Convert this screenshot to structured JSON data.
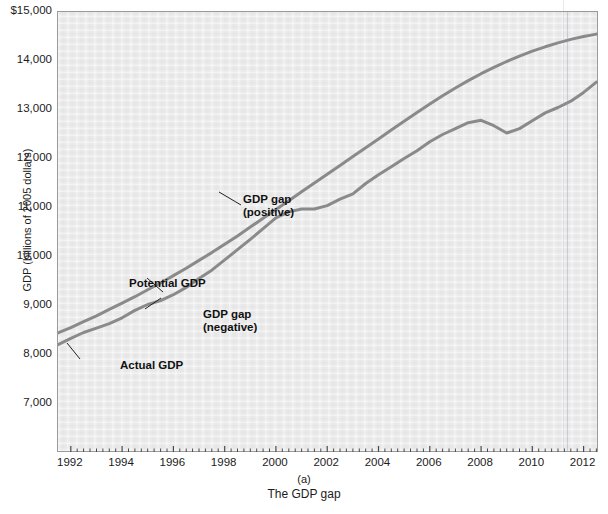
{
  "figure": {
    "panel_letter": "(a)",
    "caption": "The GDP gap"
  },
  "axes": {
    "ylabel": "GDP (billions of 2005 dollars)",
    "yticks": [
      {
        "label": "$15,000",
        "value": 15000
      },
      {
        "label": "14,000",
        "value": 14000
      },
      {
        "label": "13,000",
        "value": 13000
      },
      {
        "label": "12,000",
        "value": 12000
      },
      {
        "label": "11,000",
        "value": 11000
      },
      {
        "label": "10,000",
        "value": 10000
      },
      {
        "label": "9,000",
        "value": 9000
      },
      {
        "label": "8,000",
        "value": 8000
      },
      {
        "label": "7,000",
        "value": 7000
      }
    ],
    "xticks": [
      {
        "label": "1992",
        "value": 1992
      },
      {
        "label": "1994",
        "value": 1994
      },
      {
        "label": "1996",
        "value": 1996
      },
      {
        "label": "1998",
        "value": 1998
      },
      {
        "label": "2000",
        "value": 2000
      },
      {
        "label": "2002",
        "value": 2002
      },
      {
        "label": "2004",
        "value": 2004
      },
      {
        "label": "2006",
        "value": 2006
      },
      {
        "label": "2008",
        "value": 2008
      },
      {
        "label": "2010",
        "value": 2010
      },
      {
        "label": "2012",
        "value": 2012
      }
    ]
  },
  "annotations": [
    {
      "id": "gap-positive",
      "line1": "GDP gap",
      "line2": "(positive)"
    },
    {
      "id": "potential-gdp",
      "line1": "Potential GDP",
      "line2": ""
    },
    {
      "id": "gap-negative",
      "line1": "GDP gap",
      "line2": "(negative)"
    },
    {
      "id": "actual-gdp",
      "line1": "Actual GDP",
      "line2": ""
    }
  ],
  "colors": {
    "plot_background": "#ececec",
    "line": "#8a8a8a",
    "frame": "#9a9a9a",
    "text": "#1c1c1c"
  },
  "chart_data": {
    "type": "line",
    "title": "The GDP gap",
    "xlabel": "",
    "ylabel": "GDP (billions of 2005 dollars)",
    "xlim": [
      1991.5,
      2012.6
    ],
    "ylim": [
      6600,
      15000
    ],
    "grid": false,
    "legend": "in-plot annotations",
    "x": [
      1991.5,
      1992.0,
      1992.5,
      1993.0,
      1993.5,
      1994.0,
      1994.5,
      1995.0,
      1995.5,
      1996.0,
      1996.5,
      1997.0,
      1997.5,
      1998.0,
      1998.5,
      1999.0,
      1999.5,
      2000.0,
      2000.5,
      2001.0,
      2001.5,
      2002.0,
      2002.5,
      2003.0,
      2003.5,
      2004.0,
      2004.5,
      2005.0,
      2005.5,
      2006.0,
      2006.5,
      2007.0,
      2007.5,
      2008.0,
      2008.5,
      2009.0,
      2009.5,
      2010.0,
      2010.5,
      2011.0,
      2011.5,
      2012.0,
      2012.5
    ],
    "series": [
      {
        "name": "Potential GDP",
        "values": [
          8450,
          8560,
          8680,
          8800,
          8930,
          9060,
          9190,
          9330,
          9470,
          9620,
          9770,
          9930,
          10090,
          10260,
          10430,
          10610,
          10790,
          10970,
          11150,
          11330,
          11510,
          11690,
          11870,
          12050,
          12230,
          12410,
          12590,
          12770,
          12950,
          13120,
          13290,
          13450,
          13600,
          13740,
          13870,
          13990,
          14100,
          14200,
          14290,
          14370,
          14440,
          14500,
          14550
        ]
      },
      {
        "name": "Actual GDP",
        "values": [
          8210,
          8340,
          8460,
          8550,
          8640,
          8760,
          8910,
          9030,
          9110,
          9230,
          9380,
          9560,
          9730,
          9940,
          10150,
          10360,
          10580,
          10800,
          10920,
          10980,
          10980,
          11050,
          11180,
          11290,
          11500,
          11680,
          11840,
          12010,
          12170,
          12350,
          12500,
          12620,
          12740,
          12790,
          12680,
          12530,
          12620,
          12780,
          12940,
          13050,
          13180,
          13360,
          13570
        ]
      }
    ],
    "notes": [
      "Actual GDP lies below Potential GDP in 1992-1997 (negative GDP gap).",
      "Actual GDP rises above Potential GDP around 1999-2001 (positive GDP gap).",
      "Actual GDP falls sharply below Potential GDP during the 2008-2009 recession."
    ]
  }
}
